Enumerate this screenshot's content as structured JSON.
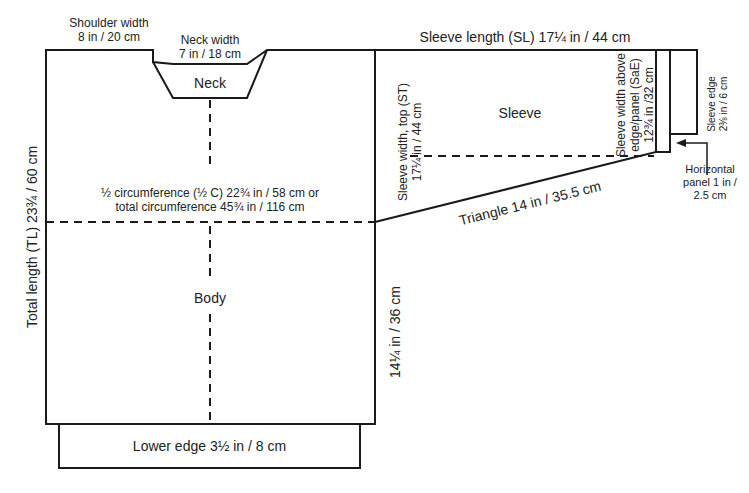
{
  "diagram": {
    "colors": {
      "line": "#1a1a1a",
      "background": "#ffffff",
      "text": "#222222"
    },
    "pieces": {
      "body": {
        "label": "Body"
      },
      "neck": {
        "label": "Neck"
      },
      "sleeve": {
        "label": "Sleeve"
      }
    },
    "measurements": {
      "shoulder_width": {
        "line1": "Shoulder width",
        "line2": "8  in / 20 cm"
      },
      "neck_width": {
        "line1": "Neck width",
        "line2": "7 in / 18 cm"
      },
      "half_circumference": {
        "line1": "½ circumference (½ C) 22¾ in / 58 cm or",
        "line2": "total circumference 45¾ in / 116 cm"
      },
      "total_length": "Total length (TL) 23¾ / 60 cm",
      "side_length": "14¼ in / 36 cm",
      "lower_edge": "Lower edge 3½ in / 8 cm",
      "sleeve_length": "Sleeve length (SL) 17¼ in / 44 cm",
      "sleeve_width_top": {
        "line1": "Sleeve width, top (ST)",
        "line2": "17¼ in / 44 cm"
      },
      "sleeve_width_above_edge": {
        "line1": "Sleeve width above",
        "line2": "edge/panel (SaE)",
        "line3": "12¾ in /32 cm"
      },
      "sleeve_edge": {
        "line1": "Sleeve  edge",
        "line2": "2⅜ in / 6 cm"
      },
      "horizontal_panel": {
        "line1": "Horizontal",
        "line2": "panel 1 in /",
        "line3": "2.5 cm"
      },
      "triangle": "Triangle 14 in / 35.5 cm"
    }
  }
}
